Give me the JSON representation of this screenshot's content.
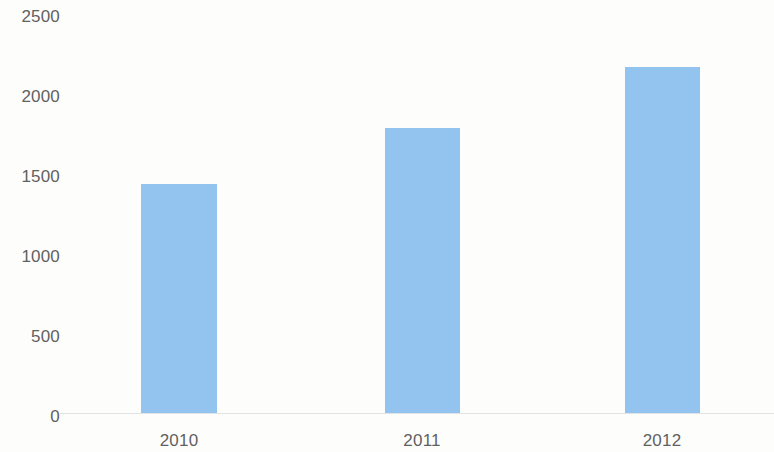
{
  "chart_data": {
    "type": "bar",
    "title": "",
    "subtitle": "",
    "xlabel": "",
    "ylabel": "",
    "categories": [
      "2010",
      "2011",
      "2012"
    ],
    "values": [
      1430,
      1780,
      2160
    ],
    "series": [
      {
        "name": "",
        "values": [
          1430,
          1780,
          2160
        ]
      }
    ],
    "ylim": [
      0,
      2500
    ],
    "y_ticks": [
      0,
      500,
      1000,
      1500,
      2000,
      2500
    ],
    "y_tick_labels": [
      "0",
      "500",
      "1000",
      "1500",
      "2000",
      "2500"
    ],
    "x_tick_labels": [
      "2010",
      "2011",
      "2012"
    ],
    "grid": false,
    "legend": null,
    "legend_position": "none",
    "data_labels": false,
    "annotations": [],
    "colors": {
      "bar_fill": "#93c4ef",
      "axis_line": "#dfe3e6",
      "tick_label": "#616161",
      "background": "#fdfdfc"
    }
  },
  "axis": {
    "y_ticks": [
      {
        "label": "2500",
        "value": 2500
      },
      {
        "label": "2000",
        "value": 2000
      },
      {
        "label": "1500",
        "value": 1500
      },
      {
        "label": "1000",
        "value": 1000
      },
      {
        "label": "500",
        "value": 500
      },
      {
        "label": "0",
        "value": 0
      }
    ],
    "x_ticks": [
      {
        "label": "2010"
      },
      {
        "label": "2011"
      },
      {
        "label": "2012"
      }
    ]
  },
  "bars": [
    {
      "category": "2010",
      "value": 1430
    },
    {
      "category": "2011",
      "value": 1780
    },
    {
      "category": "2012",
      "value": 2160
    }
  ]
}
